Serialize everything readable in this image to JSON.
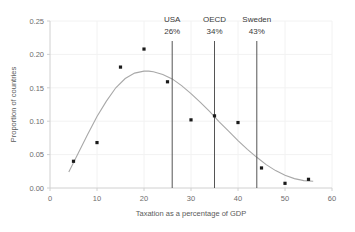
{
  "chart_data": {
    "type": "scatter",
    "title": "",
    "xlabel": "Taxation as a percentage of GDP",
    "ylabel": "Proportion of countries",
    "xlim": [
      0,
      60
    ],
    "ylim": [
      0,
      0.25
    ],
    "grid": true,
    "legend": "none",
    "xticks": [
      "0",
      "10",
      "20",
      "30",
      "40",
      "50",
      "60"
    ],
    "xtick_values": [
      0,
      10,
      20,
      30,
      40,
      50,
      60
    ],
    "yticks": [
      "0.00",
      "0.05",
      "0.10",
      "0.15",
      "0.20",
      "0.25"
    ],
    "ytick_values": [
      0.0,
      0.05,
      0.1,
      0.15,
      0.2,
      0.25
    ],
    "series": [
      {
        "name": "Proportion of countries",
        "marker": "square",
        "color": "#1a1a1a",
        "x": [
          5,
          10,
          15,
          20,
          25,
          30,
          35,
          40,
          45,
          50,
          55
        ],
        "values": [
          0.04,
          0.068,
          0.181,
          0.208,
          0.159,
          0.102,
          0.108,
          0.098,
          0.03,
          0.007,
          0.013
        ]
      },
      {
        "name": "Fitted curve",
        "type": "line",
        "color": "#a8a8a8",
        "x": [
          4,
          6,
          8,
          10,
          12,
          14,
          16,
          18,
          20,
          21,
          22,
          24,
          26,
          28,
          30,
          32,
          34,
          36,
          38,
          40,
          42,
          44,
          46,
          48,
          50,
          52,
          54,
          56
        ],
        "values": [
          0.024,
          0.052,
          0.08,
          0.107,
          0.13,
          0.15,
          0.164,
          0.172,
          0.175,
          0.175,
          0.174,
          0.17,
          0.163,
          0.153,
          0.141,
          0.128,
          0.114,
          0.099,
          0.085,
          0.071,
          0.058,
          0.046,
          0.035,
          0.026,
          0.019,
          0.014,
          0.011,
          0.01
        ]
      }
    ],
    "annotations": [
      {
        "id": "usa",
        "label": "USA",
        "value_label": "26%",
        "x": 26
      },
      {
        "id": "oecd",
        "label": "OECD",
        "value_label": "34%",
        "x": 35
      },
      {
        "id": "sweden",
        "label": "Sweden",
        "value_label": "43%",
        "x": 44
      }
    ]
  }
}
